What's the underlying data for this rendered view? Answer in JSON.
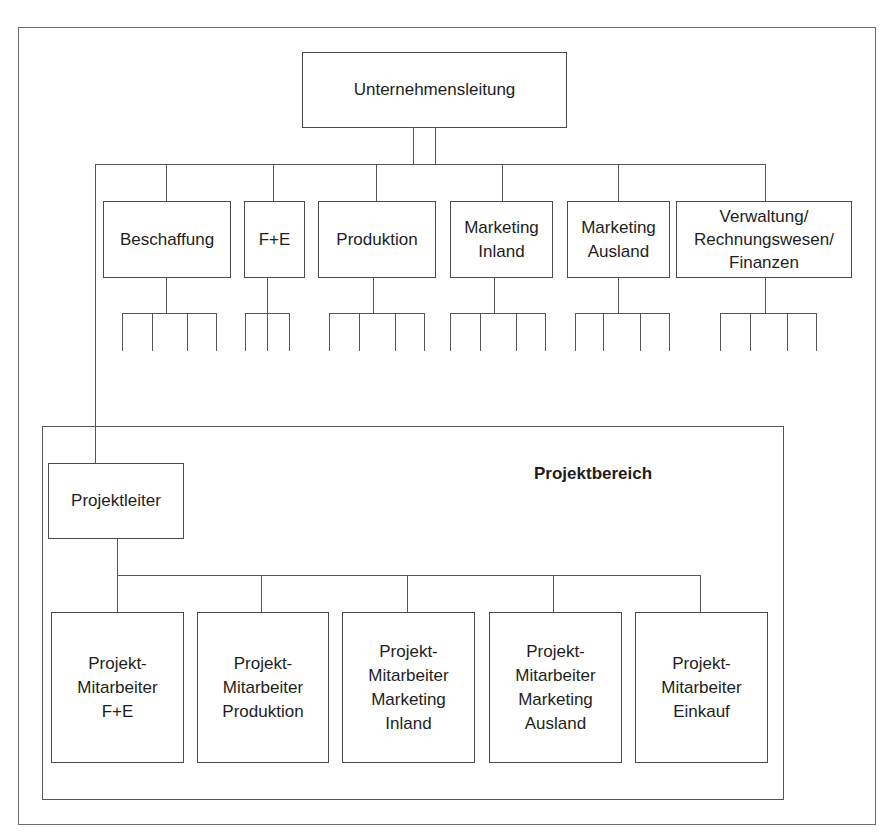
{
  "diagram": {
    "type": "org-chart",
    "root": {
      "label": "Unternehmensleitung"
    },
    "departments": [
      {
        "label": "Beschaffung",
        "sub_units": 4
      },
      {
        "label": "F+E",
        "sub_units": 3
      },
      {
        "label": "Produktion",
        "sub_units": 4
      },
      {
        "label": "Marketing\nInland",
        "sub_units": 4
      },
      {
        "label": "Marketing\nAusland",
        "sub_units": 4
      },
      {
        "label": "Verwaltung/\nRechnungswesen/\nFinanzen",
        "sub_units": 4
      }
    ],
    "project_area": {
      "title": "Projektbereich",
      "leader": {
        "label": "Projektleiter"
      },
      "members": [
        {
          "label": "Projekt-\nMitarbeiter\nF+E"
        },
        {
          "label": "Projekt-\nMitarbeiter\nProduktion"
        },
        {
          "label": "Projekt-\nMitarbeiter\nMarketing\nInland"
        },
        {
          "label": "Projekt-\nMitarbeiter\nMarketing\nAusland"
        },
        {
          "label": "Projekt-\nMitarbeiter\nEinkauf"
        }
      ]
    },
    "colors": {
      "line": "#555555",
      "text": "#1e1e1e",
      "background": "#ffffff"
    }
  }
}
